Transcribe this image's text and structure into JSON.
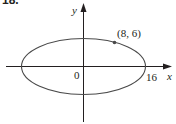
{
  "problem": {
    "number": "18."
  },
  "diagram": {
    "type": "ellipse-on-axes",
    "axes": {
      "x_label": "x",
      "y_label": "y",
      "origin_label": "0"
    },
    "ellipse": {
      "center": [
        0,
        0
      ],
      "x_intercept_label": "16"
    },
    "point": {
      "label": "(8, 6)",
      "coords": [
        8,
        6
      ]
    },
    "colors": {
      "ink": "#231f20",
      "curve": "#4a4a4a"
    }
  }
}
